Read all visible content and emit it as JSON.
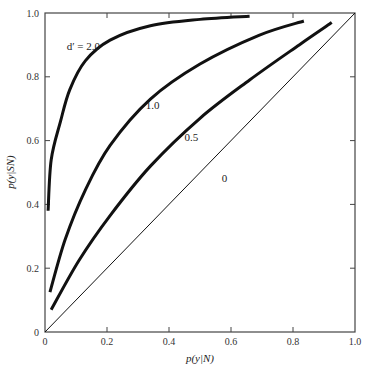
{
  "chart_data": {
    "type": "line",
    "title": "",
    "xlabel": "p(y|N)",
    "ylabel": "p(y|SN)",
    "xlim": [
      0,
      1.0
    ],
    "ylim": [
      0,
      1.0
    ],
    "grid": false,
    "legend": "inline labels",
    "x_ticks": [
      "0",
      "0.2",
      "0.4",
      "0.6",
      "0.8",
      "1.0"
    ],
    "y_ticks": [
      "0",
      "0.2",
      "0.4",
      "0.6",
      "0.8",
      "1.0"
    ],
    "series": [
      {
        "name": "d' = 2.0",
        "label": "d′ = 2.0",
        "stroke_width": 3,
        "x": [
          0.01,
          0.02,
          0.05,
          0.08,
          0.13,
          0.21,
          0.34,
          0.5,
          0.66
        ],
        "y": [
          0.38,
          0.54,
          0.66,
          0.76,
          0.85,
          0.915,
          0.96,
          0.98,
          0.99
        ]
      },
      {
        "name": "1.0",
        "label": "1.0",
        "stroke_width": 3,
        "x": [
          0.016,
          0.065,
          0.13,
          0.21,
          0.34,
          0.5,
          0.69,
          0.835
        ],
        "y": [
          0.125,
          0.29,
          0.445,
          0.585,
          0.73,
          0.84,
          0.93,
          0.975
        ]
      },
      {
        "name": "0.5",
        "label": "0.5",
        "stroke_width": 3,
        "x": [
          0.02,
          0.11,
          0.21,
          0.34,
          0.5,
          0.66,
          0.82,
          0.925
        ],
        "y": [
          0.07,
          0.225,
          0.365,
          0.52,
          0.67,
          0.79,
          0.9,
          0.97
        ]
      },
      {
        "name": "0",
        "label": "0",
        "stroke_width": 1,
        "x": [
          0,
          1.0
        ],
        "y": [
          0,
          1.0
        ]
      }
    ],
    "annotations": [
      {
        "text": "d′ = 2.0",
        "x": 0.07,
        "y": 0.885
      },
      {
        "text": "1.0",
        "x": 0.325,
        "y": 0.7
      },
      {
        "text": "0.5",
        "x": 0.45,
        "y": 0.6
      },
      {
        "text": "0",
        "x": 0.57,
        "y": 0.47
      }
    ]
  },
  "axes": {
    "x_label": "p(y|N)",
    "y_label": "p(y|SN)"
  }
}
